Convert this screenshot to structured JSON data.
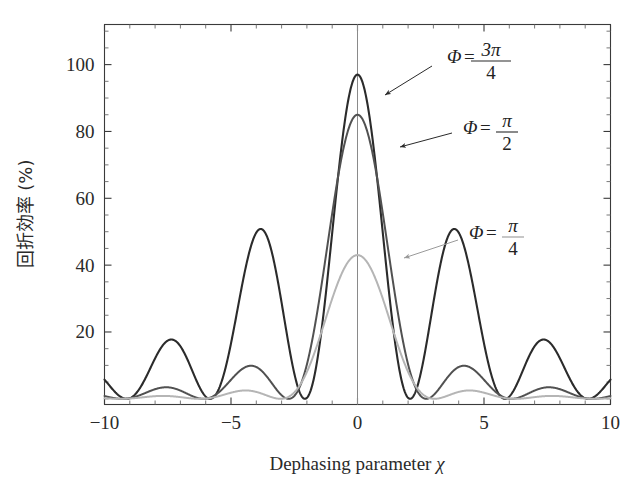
{
  "figure": {
    "title": "",
    "background": "#ffffff",
    "width": 636,
    "height": 490
  },
  "axes": {
    "x_label": "Dephasing parameter χ",
    "x_label_text": "Dephasing parameter",
    "x_label_symbol": "χ",
    "y_label": "回折効率 (%)",
    "x_ticks": [
      "−10",
      "−5",
      "0",
      "5",
      "10"
    ],
    "x_tick_values": [
      -10,
      -5,
      0,
      5,
      10
    ],
    "y_ticks": [
      "20",
      "40",
      "60",
      "80",
      "100"
    ],
    "y_tick_values": [
      20,
      40,
      60,
      80,
      100
    ],
    "xlim": [
      -10,
      10
    ],
    "ylim": [
      -1.7,
      112
    ],
    "x_minor_step": 1,
    "y_minor_step": 5,
    "frame_color": "#3a3a3a",
    "zero_line_color": "#8a8a8a",
    "grid": false
  },
  "annotations": [
    {
      "name": "phi-3pi-4",
      "symbol": "Φ",
      "equals": "=",
      "numerator": "3π",
      "denominator": "4",
      "text_x": 447,
      "text_y": 55,
      "arrow_from_x": 432,
      "arrow_from_y": 66,
      "arrow_to_x": 385,
      "arrow_to_y": 95,
      "color": "#2a2a2a"
    },
    {
      "name": "phi-pi-2",
      "symbol": "Φ",
      "equals": "=",
      "numerator": "π",
      "denominator": "2",
      "text_x": 463,
      "text_y": 126,
      "arrow_from_x": 452,
      "arrow_from_y": 133,
      "arrow_to_x": 400,
      "arrow_to_y": 147,
      "color": "#2a2a2a"
    },
    {
      "name": "phi-pi-4",
      "symbol": "Φ",
      "equals": "=",
      "numerator": "π",
      "denominator": "4",
      "text_x": 469,
      "text_y": 231,
      "arrow_from_x": 458,
      "arrow_from_y": 240,
      "arrow_to_x": 404,
      "arrow_to_y": 258,
      "color": "#9a9a9a"
    }
  ],
  "chart_data": {
    "type": "line",
    "title": "",
    "xlabel": "Dephasing parameter χ",
    "ylabel": "回折効率 (%)",
    "xlim": [
      -10,
      10
    ],
    "ylim": [
      0,
      112
    ],
    "grid": false,
    "legend_position": "inline-annotations",
    "model": "eta(chi) = 100 * Phi^2 * sin(sqrt(chi^2+Phi^2))^2 / (chi^2 + Phi^2)",
    "series": [
      {
        "name": "Φ = 3π/4",
        "phi_label": "3π/4",
        "phi_value": 2.35619449,
        "color": "#2b2b2b",
        "linewidth": 2.1,
        "peak_value": 97,
        "peak_x": 0,
        "side_lobe_peaks": [
          21.3,
          8.2,
          4.3
        ],
        "side_lobe_x": [
          4.85,
          8.05,
          11.2
        ]
      },
      {
        "name": "Φ = π/2",
        "phi_label": "π/2",
        "phi_value": 1.57079633,
        "color": "#515151",
        "linewidth": 2.0,
        "peak_value": 85,
        "peak_x": 0,
        "side_lobe_peaks": [
          9.5,
          3.6,
          1.9
        ],
        "side_lobe_x": [
          4.9,
          8.1,
          11.2
        ]
      },
      {
        "name": "Φ = π/4",
        "phi_label": "π/4",
        "phi_value": 0.78539816,
        "color": "#b5b5b5",
        "linewidth": 2.0,
        "peak_value": 43,
        "peak_x": 0,
        "side_lobe_peaks": [
          2.6,
          1.0,
          0.5
        ],
        "side_lobe_x": [
          4.95,
          8.15,
          11.3
        ]
      }
    ],
    "x_sample_range": [
      -10,
      10
    ],
    "x_sample_points": 1200
  }
}
